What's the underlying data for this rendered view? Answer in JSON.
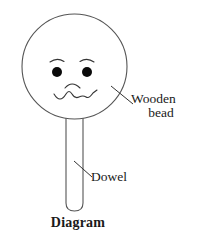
{
  "figure": {
    "caption": "Diagram",
    "background_color": "#ffffff",
    "stroke_color": "#444444",
    "text_color": "#1a1a1a",
    "fill_color": "#ffffff"
  },
  "labels": {
    "wooden_bead_line1": "Wooden",
    "wooden_bead_line2": "bead",
    "dowel": "Dowel"
  },
  "parts": {
    "bead": {
      "name": "wooden-bead",
      "shape": "circle",
      "center_x": 74.5,
      "center_y": 66.5,
      "radius": 52.5
    },
    "dowel": {
      "name": "dowel",
      "shape": "rounded-rectangle",
      "x": 66,
      "y": 112,
      "width": 17,
      "height": 99,
      "corner_radius": 8
    },
    "face": {
      "left_eye": {
        "cx": 57,
        "cy": 72,
        "r": 5
      },
      "right_eye": {
        "cx": 87,
        "cy": 72,
        "r": 5
      },
      "left_eyebrow": "arc",
      "right_eyebrow": "arc",
      "nose": "downward-arc",
      "mouth": "zigzag-wavy-line"
    }
  },
  "leader_lines": {
    "wooden_bead": {
      "from_x": 112,
      "from_y": 87,
      "to_x": 133,
      "to_y": 104
    },
    "dowel": {
      "from_x": 74,
      "from_y": 162,
      "to_x": 92,
      "to_y": 177
    }
  }
}
